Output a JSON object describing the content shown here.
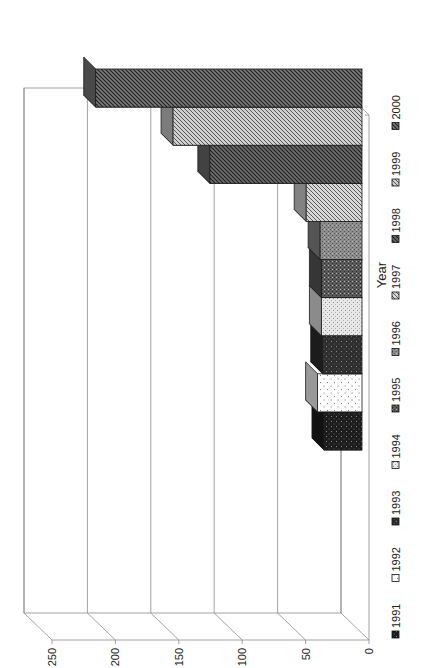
{
  "chart_data": {
    "type": "bar",
    "style": "3d-column, rotated 90deg counter-clockwise on page",
    "title": "",
    "xlabel": "Year",
    "ylabel": "",
    "categories": [
      "1991",
      "1992",
      "1993",
      "1994",
      "1995",
      "1996",
      "1997",
      "1998",
      "1999",
      "2000"
    ],
    "values": [
      30,
      35,
      31,
      32,
      32,
      33,
      44,
      120,
      149,
      210
    ],
    "ylim": [
      0,
      250
    ],
    "yticks": [
      0,
      50,
      100,
      150,
      200,
      250
    ],
    "grid": true,
    "legend_position": "bottom",
    "legend": [
      "1991",
      "1992",
      "1993",
      "1994",
      "1995",
      "1996",
      "1997",
      "1998",
      "1999",
      "2000"
    ],
    "series_styles": [
      {
        "name": "1991",
        "front": "#1c1c1c",
        "pattern": "dots-light-on-dark"
      },
      {
        "name": "1992",
        "front": "#ffffff",
        "pattern": "sparse-dots"
      },
      {
        "name": "1993",
        "front": "#2e2e2e",
        "pattern": "dense-dots-on-dark"
      },
      {
        "name": "1994",
        "front": "#e8e8e8",
        "pattern": "fine-dots"
      },
      {
        "name": "1995",
        "front": "#5a5a5a",
        "pattern": "checker"
      },
      {
        "name": "1996",
        "front": "#8c8c8c",
        "pattern": "checker-light"
      },
      {
        "name": "1997",
        "front": "#d8d8d8",
        "pattern": "diagonal-light"
      },
      {
        "name": "1998",
        "front": "#6e6e6e",
        "pattern": "diagonal-dark"
      },
      {
        "name": "1999",
        "front": "#cfcfcf",
        "pattern": "diagonal-wide-light"
      },
      {
        "name": "2000",
        "front": "#7a7a7a",
        "pattern": "diagonal-medium"
      }
    ]
  },
  "axis": {
    "x_title": "Year",
    "y_tick_labels": [
      "0",
      "50",
      "100",
      "150",
      "200",
      "250"
    ]
  }
}
